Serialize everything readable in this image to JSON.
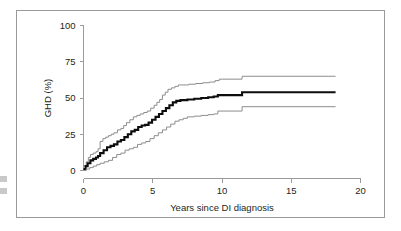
{
  "figure": {
    "frame_color": "#9a9a9a",
    "background": "#ffffff"
  },
  "chart_data": {
    "type": "line",
    "title": "",
    "subtitle": "",
    "xlabel": "Years since DI diagnosis",
    "ylabel": "GHD (%)",
    "xlim": [
      0,
      20
    ],
    "ylim": [
      0,
      100
    ],
    "xticks": [
      0,
      5,
      10,
      15,
      20
    ],
    "xticklabels": [
      "0",
      "5",
      "10",
      "15",
      "20"
    ],
    "yticks": [
      0,
      25,
      50,
      75,
      100
    ],
    "yticklabels": [
      "0",
      "25",
      "50",
      "75",
      "100"
    ],
    "grid": false,
    "legend": "none",
    "annotations": [],
    "step_style": "post",
    "series": [
      {
        "name": "Upper 95% CI",
        "style": "thin-gray",
        "color": "#8d8d8d",
        "linewidth": 1,
        "x": [
          0,
          0.2,
          0.35,
          0.5,
          0.7,
          0.9,
          1.05,
          1.2,
          1.4,
          1.6,
          1.8,
          2.0,
          2.2,
          2.45,
          2.7,
          2.9,
          3.1,
          3.35,
          3.6,
          3.85,
          4.1,
          4.35,
          4.6,
          4.85,
          5.1,
          5.3,
          5.5,
          5.7,
          5.9,
          6.1,
          6.35,
          6.6,
          6.85,
          7.1,
          7.6,
          8.1,
          8.6,
          9.1,
          9.5,
          9.8,
          11.3,
          11.45,
          18.2
        ],
        "y": [
          3,
          6,
          9,
          11,
          12,
          13,
          15,
          20,
          22,
          23,
          24,
          25,
          26,
          28,
          29,
          31,
          33,
          35,
          37,
          38,
          39,
          40,
          41,
          43,
          45,
          47,
          49,
          52,
          54,
          56,
          57,
          58,
          59,
          59,
          59.5,
          60,
          60.5,
          61,
          62,
          63,
          63,
          65,
          65
        ]
      },
      {
        "name": "Cumulative incidence of GHD",
        "style": "thick-black",
        "color": "#0d0d0d",
        "linewidth": 2.1,
        "x": [
          0,
          0.15,
          0.3,
          0.5,
          0.7,
          0.9,
          1.05,
          1.2,
          1.45,
          1.7,
          1.95,
          2.2,
          2.45,
          2.7,
          2.95,
          3.2,
          3.45,
          3.7,
          3.95,
          4.2,
          4.45,
          4.7,
          4.95,
          5.2,
          5.45,
          5.7,
          5.95,
          6.2,
          6.45,
          6.7,
          7.0,
          7.5,
          8.0,
          8.5,
          9.0,
          9.4,
          9.7,
          11.3,
          11.45,
          18.2
        ],
        "y": [
          1,
          3,
          5,
          7,
          8,
          9,
          10,
          12,
          14,
          16,
          17,
          18,
          20,
          21,
          23,
          25,
          27,
          28,
          30,
          31,
          31.5,
          33,
          35,
          37,
          39,
          41,
          43,
          45,
          47,
          48,
          48.5,
          49,
          49.5,
          50,
          50.5,
          51,
          52,
          52,
          54,
          54
        ]
      },
      {
        "name": "Lower 95% CI",
        "style": "thin-gray",
        "color": "#8d8d8d",
        "linewidth": 1,
        "x": [
          0,
          0.2,
          0.45,
          0.7,
          0.95,
          1.2,
          1.5,
          1.8,
          2.1,
          2.4,
          2.7,
          3.0,
          3.3,
          3.6,
          3.9,
          4.2,
          4.5,
          4.8,
          5.1,
          5.4,
          5.7,
          6.0,
          6.3,
          6.6,
          6.9,
          7.2,
          7.5,
          8.0,
          8.5,
          9.0,
          9.4,
          9.7,
          11.3,
          11.45,
          18.2
        ],
        "y": [
          0,
          1,
          2,
          3,
          4,
          5,
          6,
          7,
          9,
          11,
          12,
          14,
          15,
          16,
          18,
          19,
          20,
          22,
          24,
          26,
          28,
          30,
          32,
          34,
          35,
          36,
          37,
          37.5,
          38,
          38.5,
          39,
          41,
          41,
          44,
          44
        ]
      }
    ]
  }
}
